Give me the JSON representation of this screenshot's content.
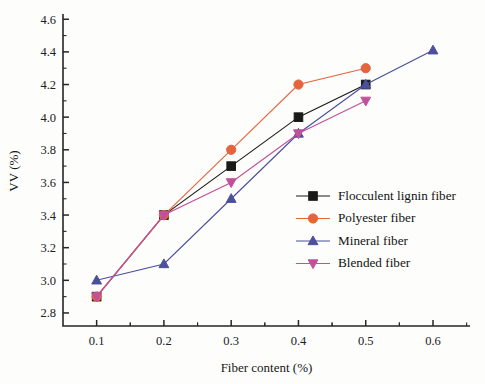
{
  "chart_data": {
    "type": "line",
    "title": "",
    "xlabel": "Fiber content (%)",
    "ylabel": "VV (%)",
    "xlim": [
      0.05,
      0.655
    ],
    "ylim": [
      2.72,
      4.62
    ],
    "xticks": [
      0.1,
      0.2,
      0.3,
      0.4,
      0.5,
      0.6
    ],
    "xticklabels": [
      "0.1",
      "0.2",
      "0.3",
      "0.4",
      "0.5",
      "0.6"
    ],
    "yticks": [
      2.8,
      3.0,
      3.2,
      3.4,
      3.6,
      3.8,
      4.0,
      4.2,
      4.4,
      4.6
    ],
    "yticklabels": [
      "2.8",
      "3.0",
      "3.2",
      "3.4",
      "3.6",
      "3.8",
      "4.0",
      "4.2",
      "4.4",
      "4.6"
    ],
    "minor_ticks": true,
    "grid": false,
    "legend_position": "lower-right",
    "series": [
      {
        "name": "Flocculent lignin fiber",
        "color": "#1a1a1a",
        "marker": "square",
        "x": [
          0.1,
          0.2,
          0.3,
          0.4,
          0.5
        ],
        "values": [
          2.9,
          3.4,
          3.7,
          4.0,
          4.2
        ]
      },
      {
        "name": "Polyester fiber",
        "color": "#e4653d",
        "marker": "circle",
        "x": [
          0.1,
          0.2,
          0.3,
          0.4,
          0.5
        ],
        "values": [
          2.9,
          3.4,
          3.8,
          4.2,
          4.3
        ]
      },
      {
        "name": "Mineral fiber",
        "color": "#4b4f9e",
        "marker": "triangle-up",
        "x": [
          0.1,
          0.2,
          0.3,
          0.4,
          0.5,
          0.6
        ],
        "values": [
          3.0,
          3.1,
          3.5,
          3.9,
          4.2,
          4.41
        ]
      },
      {
        "name": "Blended fiber",
        "color": "#c0519a",
        "marker": "triangle-down",
        "x": [
          0.1,
          0.2,
          0.3,
          0.4,
          0.5
        ],
        "values": [
          2.9,
          3.4,
          3.6,
          3.9,
          4.1
        ]
      }
    ]
  },
  "legend": {
    "items": [
      {
        "label": "Flocculent lignin fiber"
      },
      {
        "label": "Polyester fiber"
      },
      {
        "label": "Mineral fiber"
      },
      {
        "label": "Blended fiber"
      }
    ]
  }
}
